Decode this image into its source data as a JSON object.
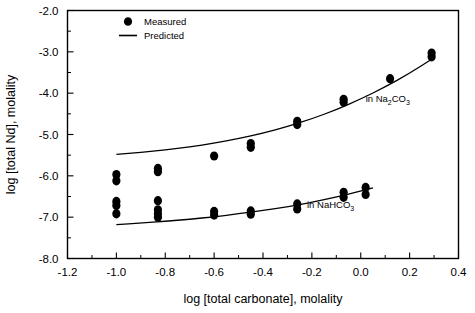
{
  "chart_data": {
    "type": "scatter",
    "title": "",
    "xlabel": "log [total carbonate], molality",
    "ylabel": "log [total Nd], molality",
    "xlim": [
      -1.2,
      0.4
    ],
    "ylim": [
      -8.0,
      -2.0
    ],
    "xticks": [
      -1.2,
      -1.0,
      -0.8,
      -0.6,
      -0.4,
      -0.2,
      0.0,
      0.2,
      0.4
    ],
    "xtick_labels": [
      "-1.2",
      "-1.0",
      "-0.8",
      "-0.6",
      "-0.4",
      "-0.2",
      "0.0",
      "0.2",
      "0.4"
    ],
    "yticks": [
      -2.0,
      -3.0,
      -4.0,
      -5.0,
      -6.0,
      -7.0,
      -8.0
    ],
    "ytick_labels": [
      "-2.0",
      "-3.0",
      "-4.0",
      "-5.0",
      "-6.0",
      "-7.0",
      "-8.0"
    ],
    "x_minor_tick_interval": 0.1,
    "y_minor_tick_interval": 0.5,
    "grid": false,
    "legend_position": "top-left-inside",
    "legend": [
      {
        "label": "Measured",
        "marker": "filled-circle"
      },
      {
        "label": "Predicted",
        "marker": "line"
      }
    ],
    "annotations": [
      {
        "text": "in Na2CO3",
        "html": "in Na<span class=\"sub\">2</span>CO<span class=\"sub\">3</span>",
        "x": 0.02,
        "y": -4.22
      },
      {
        "text": "in NaHCO3",
        "html": "in NaHCO<span class=\"sub\">3</span>",
        "x": -0.22,
        "y": -6.78
      }
    ],
    "series": [
      {
        "name": "in Na2CO3",
        "kind": "measured",
        "marker": "filled-circle",
        "points": [
          {
            "x": -1.0,
            "y": -5.97
          },
          {
            "x": -1.0,
            "y": -6.12
          },
          {
            "x": -0.83,
            "y": -5.82
          },
          {
            "x": -0.83,
            "y": -5.9
          },
          {
            "x": -0.6,
            "y": -5.52
          },
          {
            "x": -0.45,
            "y": -5.22
          },
          {
            "x": -0.45,
            "y": -5.31
          },
          {
            "x": -0.26,
            "y": -4.68
          },
          {
            "x": -0.26,
            "y": -4.76
          },
          {
            "x": -0.07,
            "y": -4.15
          },
          {
            "x": -0.07,
            "y": -4.22
          },
          {
            "x": 0.12,
            "y": -3.65
          },
          {
            "x": 0.29,
            "y": -3.03
          },
          {
            "x": 0.29,
            "y": -3.12
          }
        ]
      },
      {
        "name": "in Na2CO3 predicted",
        "kind": "predicted",
        "marker": "line",
        "points": [
          {
            "x": -1.0,
            "y": -5.48
          },
          {
            "x": -0.9,
            "y": -5.43
          },
          {
            "x": -0.8,
            "y": -5.37
          },
          {
            "x": -0.7,
            "y": -5.3
          },
          {
            "x": -0.6,
            "y": -5.21
          },
          {
            "x": -0.5,
            "y": -5.1
          },
          {
            "x": -0.4,
            "y": -4.97
          },
          {
            "x": -0.3,
            "y": -4.81
          },
          {
            "x": -0.2,
            "y": -4.62
          },
          {
            "x": -0.1,
            "y": -4.4
          },
          {
            "x": 0.0,
            "y": -4.14
          },
          {
            "x": 0.1,
            "y": -3.85
          },
          {
            "x": 0.2,
            "y": -3.52
          },
          {
            "x": 0.29,
            "y": -3.18
          }
        ]
      },
      {
        "name": "in NaHCO3",
        "kind": "measured",
        "marker": "filled-circle",
        "points": [
          {
            "x": -1.0,
            "y": -6.62
          },
          {
            "x": -1.0,
            "y": -6.72
          },
          {
            "x": -1.0,
            "y": -6.92
          },
          {
            "x": -0.83,
            "y": -6.6
          },
          {
            "x": -0.83,
            "y": -6.82
          },
          {
            "x": -0.83,
            "y": -6.92
          },
          {
            "x": -0.83,
            "y": -7.0
          },
          {
            "x": -0.6,
            "y": -6.86
          },
          {
            "x": -0.6,
            "y": -6.95
          },
          {
            "x": -0.45,
            "y": -6.85
          },
          {
            "x": -0.45,
            "y": -6.93
          },
          {
            "x": -0.26,
            "y": -6.68
          },
          {
            "x": -0.26,
            "y": -6.8
          },
          {
            "x": -0.07,
            "y": -6.4
          },
          {
            "x": -0.07,
            "y": -6.52
          },
          {
            "x": 0.02,
            "y": -6.28
          },
          {
            "x": 0.02,
            "y": -6.45
          }
        ]
      },
      {
        "name": "in NaHCO3 predicted",
        "kind": "predicted",
        "marker": "line",
        "points": [
          {
            "x": -1.0,
            "y": -7.18
          },
          {
            "x": -0.9,
            "y": -7.14
          },
          {
            "x": -0.8,
            "y": -7.1
          },
          {
            "x": -0.7,
            "y": -7.05
          },
          {
            "x": -0.6,
            "y": -6.99
          },
          {
            "x": -0.5,
            "y": -6.92
          },
          {
            "x": -0.4,
            "y": -6.84
          },
          {
            "x": -0.3,
            "y": -6.75
          },
          {
            "x": -0.2,
            "y": -6.64
          },
          {
            "x": -0.1,
            "y": -6.51
          },
          {
            "x": 0.0,
            "y": -6.37
          },
          {
            "x": 0.05,
            "y": -6.29
          }
        ]
      }
    ]
  }
}
